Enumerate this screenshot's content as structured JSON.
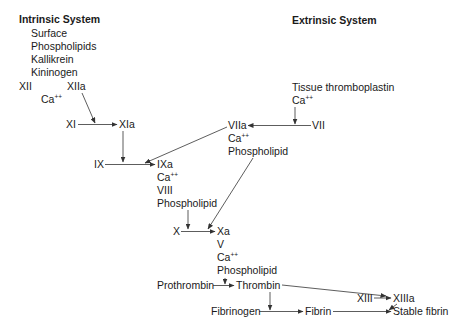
{
  "diagram": {
    "titles": {
      "intrinsic": "Intrinsic System",
      "extrinsic": "Extrinsic System"
    },
    "intrinsic_cofactors": [
      "Surface",
      "Phospholipids",
      "Kallikrein",
      "Kininogen"
    ],
    "nodes": {
      "xii": "XII",
      "xiia": "XIIa",
      "ca1": "Ca",
      "xi": "XI",
      "xia": "XIa",
      "ix": "IX",
      "ixa": "IXa",
      "ca2": "Ca",
      "viii": "VIII",
      "phospholipid1": "Phospholipid",
      "tissue_thromboplastin": "Tissue thromboplastin",
      "ca3": "Ca",
      "vii": "VII",
      "viia": "VIIa",
      "ca4": "Ca",
      "phospholipid2": "Phospholipid",
      "x": "X",
      "xa": "Xa",
      "v": "V",
      "ca5": "Ca",
      "phospholipid3": "Phospholipid",
      "prothrombin": "Prothrombin",
      "thrombin": "Thrombin",
      "xiii": "XIII",
      "xiiia": "XIIIa",
      "fibrinogen": "Fibrinogen",
      "fibrin": "Fibrin",
      "stable_fibrin": "Stable fibrin"
    },
    "superscript": "++",
    "line_color": "#333333"
  }
}
